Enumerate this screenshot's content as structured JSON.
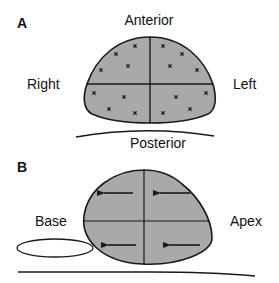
{
  "panels": [
    {
      "id": "A",
      "label": "A",
      "view": "transverse",
      "orientation_labels": {
        "top": "Anterior",
        "bottom": "Posterior",
        "left": "Right",
        "right": "Left"
      },
      "quadrants": 4,
      "markers_per_quadrant": 4,
      "marker_symbol": "x"
    },
    {
      "id": "B",
      "label": "B",
      "view": "longitudinal",
      "orientation_labels": {
        "left": "Base",
        "right": "Apex"
      },
      "quadrants": 4,
      "arrow_direction": "left",
      "arrows_count": 4
    }
  ],
  "colors": {
    "fill": "#a9a9a9",
    "stroke": "#1a1a1a",
    "text": "#111111",
    "background": "#ffffff"
  }
}
